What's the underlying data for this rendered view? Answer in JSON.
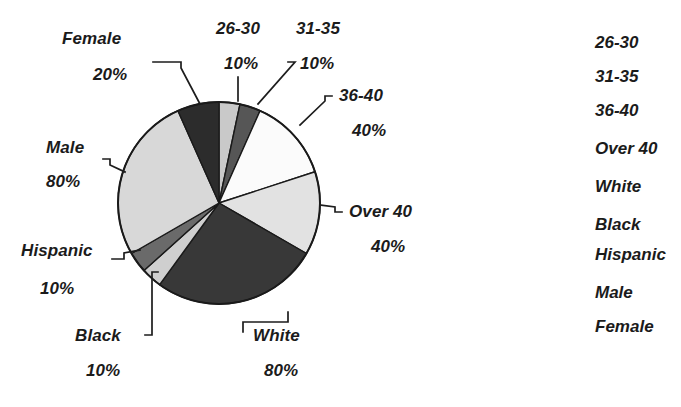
{
  "chart_data": {
    "type": "pie",
    "title": "",
    "subtitle": "",
    "xlabel": "",
    "ylabel": "",
    "legend_position": "right",
    "grid": false,
    "note": "Three demographic breakdowns (Age, Race, Gender) drawn as one composite pie; each group sums to 100% and occupies one third of the circle.",
    "categories": [
      "26-30",
      "31-35",
      "36-40",
      "Over 40",
      "White",
      "Black",
      "Hispanic",
      "Male",
      "Female"
    ],
    "values": [
      10,
      10,
      40,
      40,
      80,
      10,
      10,
      80,
      20
    ],
    "value_labels": [
      "10%",
      "10%",
      "40%",
      "40%",
      "80%",
      "10%",
      "10%",
      "80%",
      "20%"
    ],
    "groups": [
      {
        "name": "Age",
        "categories": [
          "26-30",
          "31-35",
          "36-40",
          "Over 40"
        ],
        "values": [
          10,
          10,
          40,
          40
        ]
      },
      {
        "name": "Race",
        "categories": [
          "White",
          "Black",
          "Hispanic"
        ],
        "values": [
          80,
          10,
          10
        ]
      },
      {
        "name": "Gender",
        "categories": [
          "Male",
          "Female"
        ],
        "values": [
          80,
          20
        ]
      }
    ],
    "slice_fills": [
      "#c9c9c9",
      "#565656",
      "#fbfbfb",
      "#e2e2e2",
      "#383838",
      "#cfcfcf",
      "#6a6a6a",
      "#d8d8d8",
      "#2c2c2c"
    ],
    "geometry": {
      "center_x": 219,
      "center_y": 203,
      "radius": 101,
      "start_angle_deg": -90,
      "sweep_per_group_deg": 120
    }
  },
  "callouts": [
    {
      "id": "female",
      "name": "Female",
      "percent": "20%"
    },
    {
      "id": "age26",
      "name": "26-30",
      "percent": "10%"
    },
    {
      "id": "age31",
      "name": "31-35",
      "percent": "10%"
    },
    {
      "id": "age36",
      "name": "36-40",
      "percent": "40%"
    },
    {
      "id": "over40",
      "name": "Over 40",
      "percent": "40%"
    },
    {
      "id": "male",
      "name": "Male",
      "percent": "80%"
    },
    {
      "id": "hispanic",
      "name": "Hispanic",
      "percent": "10%"
    },
    {
      "id": "black",
      "name": "Black",
      "percent": "10%"
    },
    {
      "id": "white",
      "name": "White",
      "percent": "80%"
    }
  ],
  "legend": {
    "items": [
      {
        "label": "26-30"
      },
      {
        "label": "31-35"
      },
      {
        "label": "36-40"
      },
      {
        "label": "Over 40"
      },
      {
        "label": "White"
      },
      {
        "label": "Black"
      },
      {
        "label": "Hispanic"
      },
      {
        "label": "Male"
      },
      {
        "label": "Female"
      }
    ]
  },
  "colors": {
    "text": "#1b1b1b",
    "outline": "#1a1a1a",
    "background": "#ffffff"
  }
}
